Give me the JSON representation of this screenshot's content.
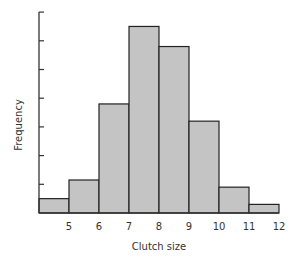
{
  "chart_data": {
    "type": "bar",
    "subtype": "histogram",
    "title": "",
    "xlabel": "Clutch size",
    "ylabel": "Frequency",
    "bin_edges": [
      4,
      5,
      6,
      7,
      8,
      9,
      10,
      11,
      12
    ],
    "categories": [
      "4-5",
      "5-6",
      "6-7",
      "7-8",
      "8-9",
      "9-10",
      "10-11",
      "11-12"
    ],
    "values": [
      0.5,
      1.15,
      3.8,
      6.5,
      5.8,
      3.2,
      0.9,
      0.3
    ],
    "x_tick_labels": [
      "5",
      "6",
      "7",
      "8",
      "9",
      "10",
      "11",
      "12"
    ],
    "y_tick_count": 7,
    "y_tick_labels": [],
    "ylim": [
      0,
      7
    ],
    "grid": false,
    "legend": null,
    "bar_fill": "#c4c4c4",
    "bar_stroke": "#222222"
  }
}
